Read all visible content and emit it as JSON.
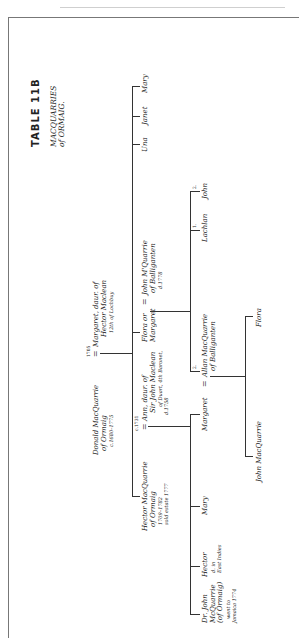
{
  "title": "TABLE 11B",
  "subtitle": [
    "MACQUARRIES",
    "of ORMAIG."
  ],
  "marriage_symbol": "=",
  "generation1": {
    "husband": {
      "lines": [
        "Donald MacQuarrie",
        "of Ormaig",
        "c.1680–1775"
      ]
    },
    "marriage_year": "1705",
    "wife": {
      "lines": [
        "Margaret, daur. of",
        "Hector Maclean",
        "12th of Lochbuy"
      ]
    }
  },
  "generation2": {
    "hector": {
      "lines": [
        "Hector MacQuarrie",
        "of Ormaig",
        "1709–1782",
        "sold estate 1777"
      ]
    },
    "hector_marriage_year": "c.1731",
    "ann": {
      "lines": [
        "Ann, daur. of",
        "Sir John Maclean",
        "of Duart, 4th Baronet,",
        "d.1758"
      ]
    },
    "flora": {
      "lines": [
        "Flora or",
        "Margaret"
      ]
    },
    "john_mquarrie": {
      "lines": [
        "John M'Quarrie",
        "of Balliganten",
        "d.1778"
      ]
    },
    "una": "Una",
    "janet": "Janet",
    "mary": "Mary"
  },
  "generation3_hector": [
    {
      "lines": [
        "Dr. John",
        "McQuarrie",
        "(of Ormaig)",
        "went to",
        "Jamaica 1774"
      ]
    },
    {
      "lines": [
        "Hector",
        "d. in",
        "East Indies"
      ]
    },
    {
      "lines": [
        "Mary"
      ]
    },
    {
      "lines": [
        "Margaret"
      ]
    }
  ],
  "generation3_flora": {
    "allan": {
      "lines": [
        "Allan MacQuarrie",
        "of Balliganten"
      ],
      "order": "2."
    },
    "lachlan": {
      "name": "Lachlan",
      "order": "1."
    },
    "john": {
      "name": "John",
      "order": "2."
    }
  },
  "generation4": [
    {
      "name": "John MacQuarrie"
    },
    {
      "name": "Flora"
    }
  ]
}
